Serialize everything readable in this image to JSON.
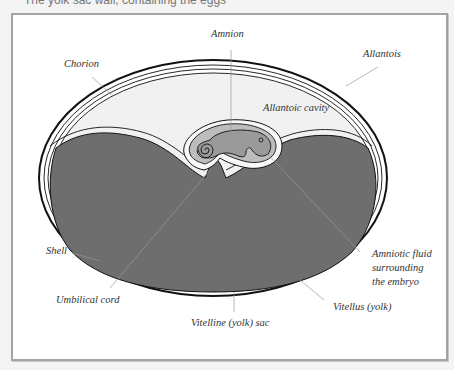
{
  "caption": "The yolk sac wall, containing the eggs",
  "diagram": {
    "labels": {
      "amnion": "Amnion",
      "chorion": "Chorion",
      "allantois": "Allantois",
      "allantoic_cavity": "Allantoic cavity",
      "shell": "Shell",
      "amniotic_fluid_line1": "Amniotic fluid",
      "amniotic_fluid_line2": "surrounding",
      "amniotic_fluid_line3": "the embryo",
      "umbilical_cord": "Umbilical cord",
      "vitellus": "Vitellus (yolk)",
      "vitelline_sac": "Vitelline (yolk) sac"
    },
    "colors": {
      "yolk": "#6e6e6e",
      "allantoic_cavity": "#f1f1f1",
      "amniotic_fluid": "#bdbdbd",
      "embryo": "#9a9a9a",
      "outline": "#111111",
      "leader_line": "#999999",
      "frame_border": "#a3a3a3"
    }
  }
}
